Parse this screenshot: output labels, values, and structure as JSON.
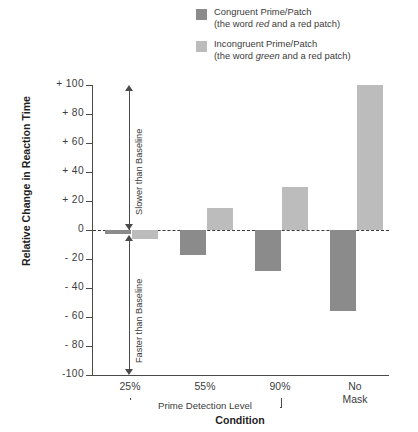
{
  "chart_data": {
    "type": "bar",
    "title": "",
    "xlabel": "Condition",
    "ylabel": "Relative Change in Reaction Time",
    "ylim": [
      -100,
      100
    ],
    "ytick_step": 20,
    "grid": false,
    "legend_position": "top-right",
    "categories": [
      "25%",
      "55%",
      "90%",
      "No Mask"
    ],
    "group_bracket_label": "Prime Detection Level",
    "group_bracket_categories": [
      "25%",
      "55%",
      "90%"
    ],
    "annotations": [
      "Slower than Baseline",
      "Faster than Baseline"
    ],
    "baseline_value": 0,
    "series": [
      {
        "name": "Congruent Prime/Patch",
        "sublabel": "(the word red and a red patch)",
        "color": "#8b8b8b",
        "values": [
          -3,
          -17,
          -28,
          -56
        ]
      },
      {
        "name": "Incongruent Prime/Patch",
        "sublabel": "(the word green and a red patch)",
        "color": "#bcbcbc",
        "values": [
          -6,
          15,
          30,
          100
        ]
      }
    ],
    "ytick_labels": [
      "+ 100",
      "+ 80",
      "+ 60",
      "+ 40",
      "+ 20",
      "0",
      "- 20",
      "- 40",
      "- 60",
      "- 80",
      "-100"
    ],
    "ytick_values": [
      100,
      80,
      60,
      40,
      20,
      0,
      -20,
      -40,
      -60,
      -80,
      -100
    ]
  },
  "legend": {
    "items": [
      {
        "label": "Congruent Prime/Patch",
        "sub_pre": "(the word ",
        "sub_em": "red",
        "sub_post": " and a red patch)",
        "color": "#8b8b8b"
      },
      {
        "label": "Incongruent Prime/Patch",
        "sub_pre": "(the word ",
        "sub_em": "green",
        "sub_post": " and a red patch)",
        "color": "#bcbcbc"
      }
    ]
  },
  "axes": {
    "y_title": "Relative Change in Reaction Time",
    "x_title": "Condition",
    "slower_label": "Slower than Baseline",
    "faster_label": "Faster than Baseline",
    "bracket_label": "Prime Detection Level"
  }
}
